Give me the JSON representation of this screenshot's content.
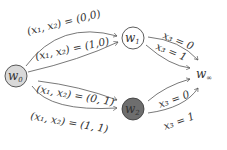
{
  "nodes": {
    "w0": {
      "base": "w",
      "sub": "0",
      "fill": "#d9d9d9",
      "stroke": "#333333"
    },
    "w1": {
      "base": "w",
      "sub": "1",
      "fill": "#ffffff",
      "stroke": "#333333"
    },
    "w2": {
      "base": "w",
      "sub": "2",
      "fill": "#6e6e6e",
      "stroke": "#333333"
    },
    "winf": {
      "base": "w",
      "sub": "∞"
    }
  },
  "edges": {
    "w0_w1_a": "(x₁, x₂) = (0,0)",
    "w0_w1_b": "(x₁, x₂) = (1,0)",
    "w0_w2_a": "(x₁, x₂) = (0, 1)",
    "w0_w2_b": "(x₁, x₂) = (1, 1)",
    "w1_winf_a": "x₃ = 0",
    "w1_winf_b": "x₃ = 1",
    "w2_winf_a": "x₃ = 0",
    "w2_winf_b": "x₃ = 1"
  }
}
